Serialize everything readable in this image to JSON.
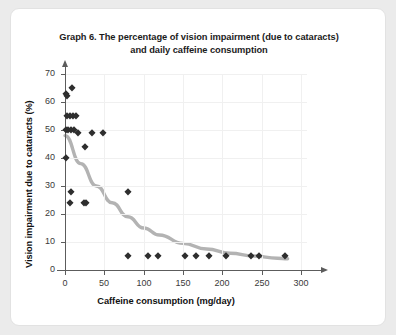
{
  "card": {
    "background": "#ffffff",
    "border_color": "#e2e2e2"
  },
  "chart_data": {
    "type": "scatter",
    "title": "Graph 6. The percentage of vision impairment (due to cataracts) and daily caffeine consumption",
    "title_line1": "Graph 6. The percentage of vision impairment (due to cataracts)",
    "title_line2": "and daily caffeine consumption",
    "xlabel": "Caffeine consumption (mg/day)",
    "ylabel": "Vision impairment due to cataracts (%)",
    "xlim": [
      0,
      300
    ],
    "ylim": [
      0,
      70
    ],
    "xticks": [
      0,
      50,
      100,
      150,
      200,
      250,
      300
    ],
    "yticks": [
      0,
      10,
      20,
      30,
      40,
      50,
      60,
      70
    ],
    "grid": true,
    "legend": "none",
    "marker": "diamond",
    "marker_color": "#2e2e2e",
    "trend_color": "#b3b3b3",
    "points": [
      {
        "x": 1,
        "y": 63
      },
      {
        "x": 2,
        "y": 62
      },
      {
        "x": 9,
        "y": 65
      },
      {
        "x": 2,
        "y": 55
      },
      {
        "x": 6,
        "y": 55
      },
      {
        "x": 10,
        "y": 55
      },
      {
        "x": 14,
        "y": 55
      },
      {
        "x": 1,
        "y": 50
      },
      {
        "x": 4,
        "y": 50
      },
      {
        "x": 8,
        "y": 50
      },
      {
        "x": 12,
        "y": 50
      },
      {
        "x": 16,
        "y": 49
      },
      {
        "x": 34,
        "y": 49
      },
      {
        "x": 48,
        "y": 49
      },
      {
        "x": 1,
        "y": 40
      },
      {
        "x": 25,
        "y": 44
      },
      {
        "x": 7,
        "y": 28
      },
      {
        "x": 80,
        "y": 28
      },
      {
        "x": 6,
        "y": 24
      },
      {
        "x": 24,
        "y": 24
      },
      {
        "x": 27,
        "y": 24
      },
      {
        "x": 80,
        "y": 5
      },
      {
        "x": 105,
        "y": 5
      },
      {
        "x": 118,
        "y": 5
      },
      {
        "x": 152,
        "y": 5
      },
      {
        "x": 167,
        "y": 5
      },
      {
        "x": 183,
        "y": 5
      },
      {
        "x": 205,
        "y": 5
      },
      {
        "x": 237,
        "y": 5
      },
      {
        "x": 247,
        "y": 5
      },
      {
        "x": 280,
        "y": 5
      }
    ],
    "trend_curve": {
      "description": "decaying exponential fit",
      "points": [
        {
          "x": 0,
          "y": 48
        },
        {
          "x": 20,
          "y": 38
        },
        {
          "x": 40,
          "y": 30
        },
        {
          "x": 60,
          "y": 24
        },
        {
          "x": 80,
          "y": 19
        },
        {
          "x": 100,
          "y": 15
        },
        {
          "x": 120,
          "y": 12.5
        },
        {
          "x": 150,
          "y": 9.5
        },
        {
          "x": 180,
          "y": 7.5
        },
        {
          "x": 210,
          "y": 6
        },
        {
          "x": 240,
          "y": 5
        },
        {
          "x": 270,
          "y": 4.2
        },
        {
          "x": 283,
          "y": 4
        }
      ]
    }
  }
}
